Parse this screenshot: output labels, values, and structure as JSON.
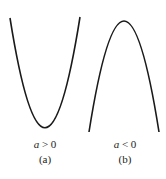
{
  "figure": {
    "panels": [
      {
        "id": "a",
        "condition_var": "a",
        "condition_rest": " > 0",
        "caption": "(a)",
        "shape": "upward-opening parabola",
        "path": "M10,18 Q45,238 80,17"
      },
      {
        "id": "b",
        "condition_var": "a",
        "condition_rest": " < 0",
        "caption": "(b)",
        "shape": "downward-opening parabola",
        "path": "M89,132 Q124,-90 159,132"
      }
    ],
    "stroke_color": "#1a1a1a"
  }
}
